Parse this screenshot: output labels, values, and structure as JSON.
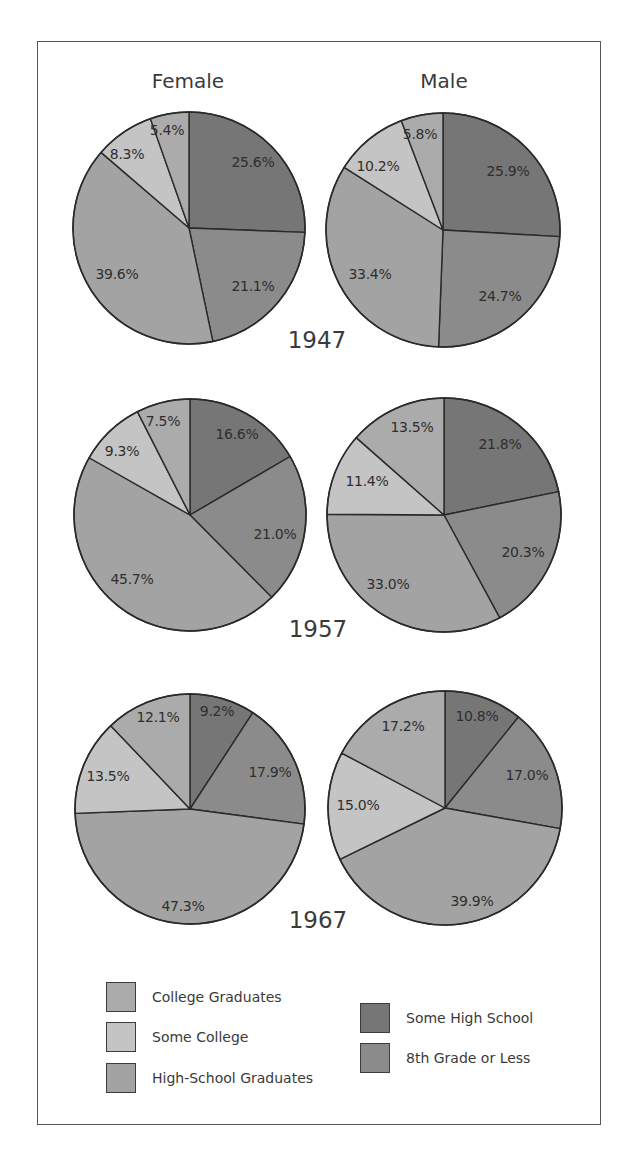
{
  "chart_data": {
    "type": "pie",
    "title": "",
    "columns": [
      "Female",
      "Male"
    ],
    "years": [
      "1947",
      "1957",
      "1967"
    ],
    "categories": [
      "8th Grade or Less",
      "Some High School",
      "High-School Graduates",
      "Some College",
      "College Graduates"
    ],
    "slice_order": "clockwise from 12 o'clock",
    "colors": {
      "8th Grade or Less": "#767676",
      "Some High School": "#8b8b8b",
      "High-School Graduates": "#a3a3a3",
      "Some College": "#c4c4c4",
      "College Graduates": "#ababab"
    },
    "pies": [
      {
        "year": "1947",
        "sex": "Female",
        "values": [
          25.6,
          21.1,
          39.6,
          8.3,
          5.4
        ]
      },
      {
        "year": "1947",
        "sex": "Male",
        "values": [
          25.9,
          24.7,
          33.4,
          10.2,
          5.8
        ]
      },
      {
        "year": "1957",
        "sex": "Female",
        "values": [
          16.6,
          21.0,
          45.7,
          9.3,
          7.5
        ]
      },
      {
        "year": "1957",
        "sex": "Male",
        "values": [
          21.8,
          20.3,
          33.0,
          11.4,
          13.5
        ]
      },
      {
        "year": "1967",
        "sex": "Female",
        "values": [
          9.2,
          17.9,
          47.3,
          13.5,
          12.1
        ]
      },
      {
        "year": "1967",
        "sex": "Male",
        "values": [
          10.8,
          17.0,
          39.9,
          15.0,
          17.2
        ]
      }
    ],
    "value_labels": [
      [
        "25.6%",
        "21.1%",
        "39.6%",
        "8.3%",
        "5.4%"
      ],
      [
        "25.9%",
        "24.7%",
        "33.4%",
        "10.2%",
        "5.8%"
      ],
      [
        "16.6%",
        "21.0%",
        "45.7%",
        "9.3%",
        "7.5%"
      ],
      [
        "21.8%",
        "20.3%",
        "33.0%",
        "11.4%",
        "13.5%"
      ],
      [
        "9.2%",
        "17.9%",
        "47.3%",
        "13.5%",
        "12.1%"
      ],
      [
        "10.8%",
        "17.0%",
        "39.9%",
        "15.0%",
        "17.2%"
      ]
    ],
    "legend": {
      "position": "bottom",
      "left_column": [
        "College Graduates",
        "Some College",
        "High-School Graduates"
      ],
      "right_column": [
        "Some High School",
        "8th Grade or Less"
      ]
    }
  },
  "headers": {
    "female": "Female",
    "male": "Male"
  },
  "year_labels": {
    "y1947": "1947",
    "y1957": "1957",
    "y1967": "1967"
  },
  "legend": {
    "college_graduates": "College Graduates",
    "some_college": "Some College",
    "high_school_graduates": "High-School Graduates",
    "some_high_school": "Some High School",
    "eighth_grade_or_less": "8th Grade or Less"
  }
}
